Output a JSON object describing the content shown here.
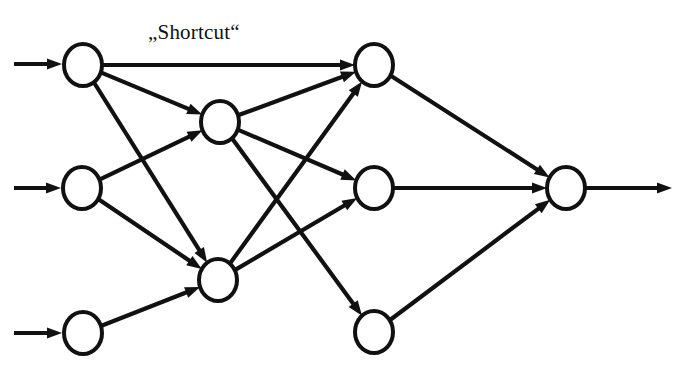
{
  "diagram": {
    "kind": "neural-network-graph",
    "title_text": "„Shortcut“",
    "label": {
      "text": "„Shortcut“",
      "x": 148,
      "y": 22
    },
    "style": {
      "background_color": "#ffffff",
      "stroke_color": "#111111",
      "node_fill_color": "#ffffff",
      "edge_stroke_width": 4.2,
      "node_stroke_width": 4.0,
      "node_rx": 19,
      "node_ry": 21
    },
    "layers": [
      {
        "name": "input-layer",
        "nodes": [
          {
            "id": "i1",
            "label": "",
            "cx": 83,
            "cy": 65
          },
          {
            "id": "i2",
            "label": "",
            "cx": 82,
            "cy": 188
          },
          {
            "id": "i3",
            "label": "",
            "cx": 83,
            "cy": 333
          }
        ]
      },
      {
        "name": "hidden-layer",
        "nodes": [
          {
            "id": "h1",
            "label": "",
            "cx": 220,
            "cy": 122
          },
          {
            "id": "h2",
            "label": "",
            "cx": 218,
            "cy": 280
          }
        ]
      },
      {
        "name": "third-layer",
        "nodes": [
          {
            "id": "t1",
            "label": "",
            "cx": 374,
            "cy": 65
          },
          {
            "id": "t2",
            "label": "",
            "cx": 374,
            "cy": 188
          },
          {
            "id": "t3",
            "label": "",
            "cx": 374,
            "cy": 332
          }
        ]
      },
      {
        "name": "output-layer",
        "nodes": [
          {
            "id": "o1",
            "label": "",
            "cx": 566,
            "cy": 188
          }
        ]
      }
    ],
    "stub_arrows": [
      {
        "id": "in1",
        "name": "input-arrow-1",
        "x1": 14,
        "y1": 64,
        "x2": 62,
        "y2": 64
      },
      {
        "id": "in2",
        "name": "input-arrow-2",
        "x1": 14,
        "y1": 188,
        "x2": 61,
        "y2": 188
      },
      {
        "id": "in3",
        "name": "input-arrow-3",
        "x1": 14,
        "y1": 333,
        "x2": 62,
        "y2": 333
      },
      {
        "id": "out1",
        "name": "output-arrow",
        "x1": 586,
        "y1": 188,
        "x2": 672,
        "y2": 188
      }
    ],
    "edges": [
      {
        "id": "e-i1-t1",
        "name": "shortcut-edge",
        "from": "i1",
        "to": "t1",
        "is_shortcut": true
      },
      {
        "id": "e-i1-h1",
        "name": "edge-input1-hidden1",
        "from": "i1",
        "to": "h1",
        "is_shortcut": false
      },
      {
        "id": "e-i1-h2",
        "name": "edge-input1-hidden2",
        "from": "i1",
        "to": "h2",
        "is_shortcut": false
      },
      {
        "id": "e-i2-h1",
        "name": "edge-input2-hidden1",
        "from": "i2",
        "to": "h1",
        "is_shortcut": false
      },
      {
        "id": "e-i2-h2",
        "name": "edge-input2-hidden2",
        "from": "i2",
        "to": "h2",
        "is_shortcut": false
      },
      {
        "id": "e-i3-h2",
        "name": "edge-input3-hidden2",
        "from": "i3",
        "to": "h2",
        "is_shortcut": false
      },
      {
        "id": "e-h1-t1",
        "name": "edge-hidden1-third1",
        "from": "h1",
        "to": "t1",
        "is_shortcut": false
      },
      {
        "id": "e-h1-t2",
        "name": "edge-hidden1-third2",
        "from": "h1",
        "to": "t2",
        "is_shortcut": false
      },
      {
        "id": "e-h1-t3",
        "name": "edge-hidden1-third3",
        "from": "h1",
        "to": "t3",
        "is_shortcut": false
      },
      {
        "id": "e-h2-t1",
        "name": "edge-hidden2-third1",
        "from": "h2",
        "to": "t1",
        "is_shortcut": false
      },
      {
        "id": "e-h2-t2",
        "name": "edge-hidden2-third2",
        "from": "h2",
        "to": "t2",
        "is_shortcut": false
      },
      {
        "id": "e-t1-o1",
        "name": "edge-third1-output",
        "from": "t1",
        "to": "o1",
        "is_shortcut": false
      },
      {
        "id": "e-t2-o1",
        "name": "edge-third2-output",
        "from": "t2",
        "to": "o1",
        "is_shortcut": false
      },
      {
        "id": "e-t3-o1",
        "name": "edge-third3-output",
        "from": "t3",
        "to": "o1",
        "is_shortcut": false
      }
    ]
  }
}
